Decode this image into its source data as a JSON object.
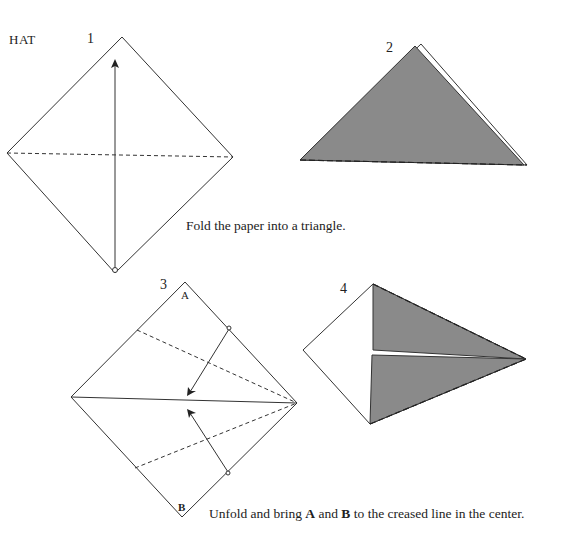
{
  "title": "HAT",
  "steps": [
    {
      "number": "1"
    },
    {
      "number": "2"
    },
    {
      "number": "3",
      "labels": {
        "top": "A",
        "bottom": "B"
      }
    },
    {
      "number": "4"
    }
  ],
  "captions": {
    "step1": "Fold the paper into a triangle.",
    "step3_pre": "Unfold and bring ",
    "step3_a": "A",
    "step3_mid": " and ",
    "step3_b": "B",
    "step3_post": " to the creased line in the center."
  },
  "colors": {
    "line": "#333333",
    "fill_gray": "#8a8a8a",
    "background": "#ffffff"
  }
}
